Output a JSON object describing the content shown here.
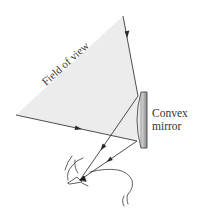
{
  "figure": {
    "type": "optics-diagram",
    "labels": {
      "field_of_view": "Field of view",
      "mirror_line1": "Convex",
      "mirror_line2": "mirror"
    },
    "colors": {
      "field_fill": "#ededed",
      "ray": "#3a3a3a",
      "mirror_light": "#f2f2f2",
      "mirror_dark": "#8f8f8f",
      "outline": "#444444"
    }
  }
}
